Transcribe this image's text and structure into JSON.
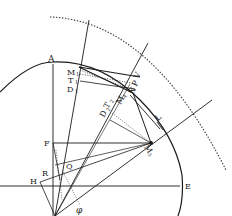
{
  "diagram": {
    "type": "geometric-construction",
    "colors": {
      "ink": "#1a1a1a",
      "paper": "#ffffff",
      "dotted": "#333333"
    },
    "labels": {
      "A": "A",
      "M1": "M",
      "M1_sub": "1",
      "T1": "T",
      "T1_sub": "1",
      "D1": "D",
      "D1_sub": "1",
      "V": "V",
      "P": "P",
      "N": "N",
      "M4": "M",
      "M4_sub": "4",
      "T2": "T",
      "T2_sub": "2",
      "D2": "D",
      "D2_sub": "2",
      "L": "L",
      "M5": "M",
      "M5_sub": "5",
      "F": "F",
      "Q": "Q",
      "R": "R",
      "H": "H",
      "E": "E",
      "phi": "φ"
    }
  }
}
